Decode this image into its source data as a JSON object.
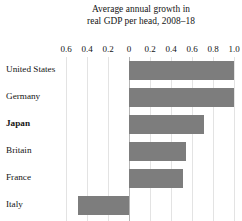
{
  "chart_data": {
    "type": "bar",
    "orientation": "horizontal",
    "title": "Average annual growth in real GDP per head, 2008–18",
    "title_lines": [
      "Average annual growth in",
      "real GDP per head, 2008–18"
    ],
    "categories": [
      "United States",
      "Germany",
      "Japan",
      "Britain",
      "France",
      "Italy"
    ],
    "values": [
      1.0,
      1.0,
      0.71,
      0.54,
      0.51,
      -0.49
    ],
    "emphasized_category": "Japan",
    "xlabel": "",
    "ylabel": "",
    "xlim": [
      -0.6,
      1.0
    ],
    "xtick_values": [
      -0.6,
      -0.4,
      -0.2,
      0,
      0.2,
      0.4,
      0.6,
      0.8,
      1.0
    ],
    "xtick_labels": [
      "0.6",
      "0.4",
      "0.2",
      "0",
      "0.2",
      "0.4",
      "0.6",
      "0.8",
      "1.0"
    ],
    "grid": true,
    "legend": false,
    "bar_color": "#7d7d7d",
    "gridline_color": "#e3e3e3",
    "zero_line_color": "#b4b4b4",
    "background_color": "#ffffff",
    "text_color": "#141414"
  }
}
